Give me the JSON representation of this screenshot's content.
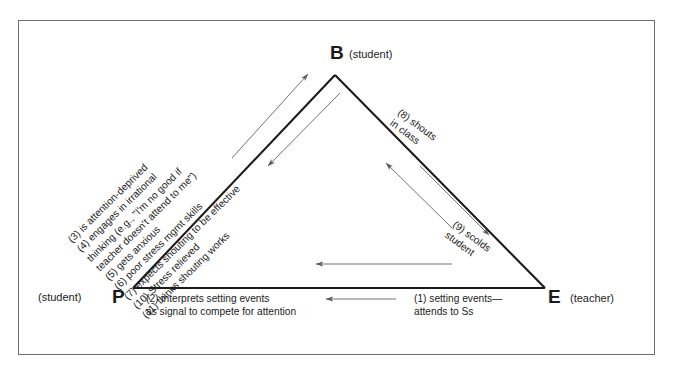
{
  "figure": {
    "type": "cyclic triangle interaction diagram",
    "vertices": [
      {
        "id": "B",
        "letter": "B",
        "role": "(student)",
        "position": "top-apex"
      },
      {
        "id": "P",
        "letter": "P",
        "role": "(student)",
        "position": "bottom-left"
      },
      {
        "id": "E",
        "letter": "E",
        "role": "(teacher)",
        "position": "bottom-right"
      }
    ],
    "steps": [
      {
        "num": "(1)",
        "text_line1": "(1) setting events—",
        "text_line2": "attends to Ss",
        "edge": "E-to-P",
        "direction": "leftward"
      },
      {
        "num": "(2)",
        "text_line1": "(2) interprets setting events",
        "text_line2": "as signal to compete for attention",
        "edge": "P",
        "direction": "none"
      },
      {
        "num": "(3)",
        "text": "(3) is attention-deprived",
        "edge": "P-to-B",
        "direction": "upward"
      },
      {
        "num": "(4)",
        "text": "(4) engages in irrational",
        "edge": "P-to-B",
        "direction": "upward"
      },
      {
        "num": "(4b)",
        "text": "thinking (e.g., \"I'm no good if",
        "edge": "P-to-B",
        "direction": "upward"
      },
      {
        "num": "(4c)",
        "text": "teacher doesn't attend to me\")",
        "edge": "P-to-B",
        "direction": "upward"
      },
      {
        "num": "(5)",
        "text": "(5) gets anxious",
        "edge": "P-to-B",
        "direction": "upward"
      },
      {
        "num": "(6)",
        "text": "(6) poor stress mgmt skills",
        "edge": "P-to-B",
        "direction": "upward"
      },
      {
        "num": "(7)",
        "text": "(7) expects shouting to be effective",
        "edge": "P-to-B",
        "direction": "upward"
      },
      {
        "num": "(8)",
        "text_line1": "(8) shouts",
        "text_line2": "in class",
        "edge": "B-to-E",
        "direction": "down-right"
      },
      {
        "num": "(9)",
        "text_line1": "(9) scolds",
        "text_line2": "student",
        "edge": "E-to-B",
        "direction": "up-left"
      },
      {
        "num": "(10)",
        "text": "(10) Stress relieved",
        "edge": "B-to-P",
        "direction": "downward"
      },
      {
        "num": "(11)",
        "text": "(11) thinks shouting works",
        "edge": "B-to-P",
        "direction": "downward"
      }
    ],
    "left_edge_stack": [
      "(3) is attention-deprived",
      "(4) engages in irrational",
      "thinking (e.g., \"I'm no good if",
      "teacher doesn't attend to me\")",
      "(5) gets anxious",
      "(6) poor stress mgmt skills",
      "(7) expects shouting to be effective",
      "(10) Stress relieved",
      "(11) thinks shouting works"
    ],
    "right_edge_top": {
      "line1": "(8) shouts",
      "line2": "in class"
    },
    "right_edge_bottom": {
      "line1": "(9) scolds",
      "line2": "student"
    },
    "bottom_left_block": {
      "line1": "(2) interprets setting events",
      "line2": "as signal to compete for attention"
    },
    "bottom_right_block": {
      "line1": "(1) setting events—",
      "line2": "attends to Ss"
    },
    "colors": {
      "frame": "#6e6e6e",
      "triangle": "#1b1b1b",
      "arrow": "#5a5a5a",
      "text": "#1b1b1b",
      "background": "#ffffff"
    }
  }
}
